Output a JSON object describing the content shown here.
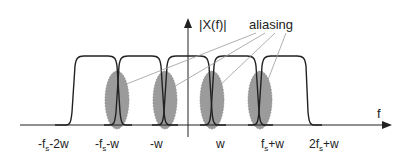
{
  "title": "|X(f)|",
  "annotation": "aliasing",
  "axis": {
    "x_label": "f",
    "y_label": "|X(f)|"
  },
  "tick_labels": [
    {
      "base": "-f",
      "sub": "s",
      "rest": "-2w"
    },
    {
      "base": "-f",
      "sub": "s",
      "rest": "-w"
    },
    {
      "base": "-w",
      "sub": "",
      "rest": ""
    },
    {
      "base": "w",
      "sub": "",
      "rest": ""
    },
    {
      "base": "f",
      "sub": "s",
      "rest": "+w"
    },
    {
      "base": "2f",
      "sub": "s",
      "rest": "+w"
    }
  ],
  "colors": {
    "line": "#222222",
    "aliasing_region": "#8a8a8a",
    "pointer": "#9a9a9a"
  },
  "pulses": 5,
  "aliasing_regions": 4
}
